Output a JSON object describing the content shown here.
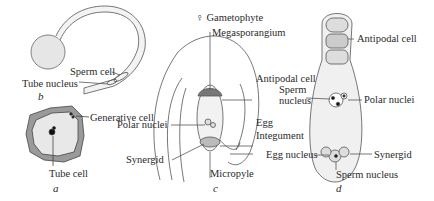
{
  "figure": {
    "panels": [
      {
        "id": "a",
        "letter": "a",
        "subject": "pollen grain",
        "labels": {
          "generative_cell": "Generative cell",
          "tube_cell": "Tube cell"
        }
      },
      {
        "id": "b",
        "letter": "b",
        "subject": "germinating pollen tube",
        "labels": {
          "sperm_cell": "Sperm cell",
          "tube_nucleus": "Tube nucleus"
        }
      },
      {
        "id": "c",
        "letter": "c",
        "subject": "ovule",
        "labels": {
          "gametophyte": "♀ Gametophyte",
          "megasporangium": "Megasporangium",
          "antipodal_cell": "Antipodal cell",
          "polar_nuclei": "Polar nuclei",
          "egg": "Egg",
          "integument": "Integument",
          "synergid": "Synergid",
          "micropyle": "Micropyle"
        }
      },
      {
        "id": "d",
        "letter": "d",
        "subject": "embryo sac at fertilization",
        "labels": {
          "antipodal_cell": "Antipodal cell",
          "sperm_nucleus_top_1": "Sperm",
          "sperm_nucleus_top_2": "nucleus",
          "polar_nuclei": "Polar nuclei",
          "egg_nucleus": "Egg nucleus",
          "synergid": "Synergid",
          "sperm_nucleus_bottom": "Sperm nucleus"
        }
      }
    ]
  }
}
